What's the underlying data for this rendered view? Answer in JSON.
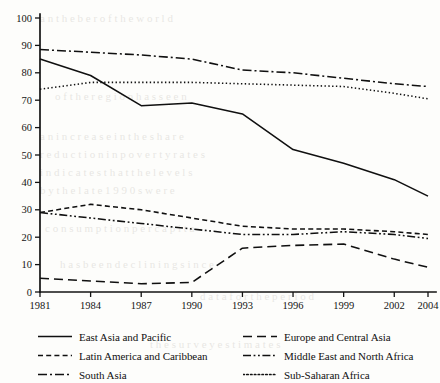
{
  "chart_data": {
    "type": "line",
    "title": "",
    "subtitle": "",
    "xlabel": "",
    "ylabel": "",
    "xlim": [
      1981,
      2004
    ],
    "ylim": [
      0,
      100
    ],
    "grid": false,
    "legend_position": "bottom",
    "x": [
      1981,
      1984,
      1987,
      1990,
      1993,
      1996,
      1999,
      2002,
      2004
    ],
    "x_tick_labels": [
      "1981",
      "1984",
      "1987",
      "1990",
      "1993",
      "1996",
      "1999",
      "2002",
      "2004"
    ],
    "y_tick_labels": [
      "0",
      "10",
      "20",
      "30",
      "40",
      "50",
      "60",
      "70",
      "80",
      "90",
      "100"
    ],
    "y_ticks": [
      0,
      10,
      20,
      30,
      40,
      50,
      60,
      70,
      80,
      90,
      100
    ],
    "series": [
      {
        "name": "East Asia and Pacific",
        "dash": "solid",
        "values": [
          85,
          79,
          68,
          69,
          65,
          52,
          47,
          41,
          35
        ]
      },
      {
        "name": "Europe and Central Asia",
        "dash": "long-dash",
        "values": [
          5,
          4,
          3,
          3.5,
          16,
          17,
          17.5,
          12,
          9
        ]
      },
      {
        "name": "Latin America and Caribbean",
        "dash": "short-dash",
        "values": [
          29,
          32,
          30,
          27,
          24,
          23,
          23,
          22,
          21
        ]
      },
      {
        "name": "Middle East and North Africa",
        "dash": "dash-dot-dot",
        "values": [
          29,
          27,
          25,
          23,
          21,
          21,
          22,
          21,
          19.5
        ]
      },
      {
        "name": "South Asia",
        "dash": "dash-dot",
        "values": [
          88.5,
          87.5,
          86.5,
          85,
          81,
          80,
          78,
          76,
          75
        ]
      },
      {
        "name": "Sub-Saharan Africa",
        "dash": "dotted",
        "values": [
          74,
          76.5,
          76.5,
          76.5,
          76,
          75.5,
          75,
          72.5,
          70.5
        ]
      }
    ]
  },
  "legend": {
    "entries": [
      {
        "label": "East Asia and Pacific",
        "swatch": "solid-line-swatch"
      },
      {
        "label": "Europe and Central Asia",
        "swatch": "long-dash-line-swatch"
      },
      {
        "label": "Latin America and Caribbean",
        "swatch": "short-dash-line-swatch"
      },
      {
        "label": "Middle East and North Africa",
        "swatch": "dash-dot-dot-line-swatch"
      },
      {
        "label": "South Asia",
        "swatch": "dash-dot-line-swatch"
      },
      {
        "label": "Sub-Saharan Africa",
        "swatch": "dotted-line-swatch"
      }
    ]
  },
  "colors": {
    "ink": "#101010",
    "page": "#fdfdfb"
  }
}
